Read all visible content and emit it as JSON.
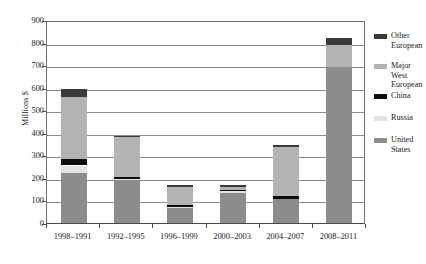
{
  "chart_data": {
    "type": "bar",
    "stacked": true,
    "title": "",
    "xlabel": "",
    "ylabel": "Millions $",
    "ylim": [
      0,
      900
    ],
    "ytick_step": 100,
    "yticks": [
      0,
      100,
      200,
      300,
      400,
      500,
      600,
      700,
      800,
      900
    ],
    "grid": true,
    "legend_position": "right",
    "categories": [
      "1998–1991",
      "1992–1995",
      "1996–1999",
      "2000–2003",
      "2004–2007",
      "2008–2011"
    ],
    "series": [
      {
        "name": "United States",
        "color": "#8c8c8c",
        "values": [
          220,
          190,
          65,
          133,
          105,
          690
        ]
      },
      {
        "name": "Russia",
        "color": "#e3e3e3",
        "values": [
          35,
          5,
          5,
          7,
          0,
          0
        ]
      },
      {
        "name": "China",
        "color": "#0d0d0d",
        "values": [
          30,
          10,
          8,
          8,
          13,
          0
        ]
      },
      {
        "name": "Major West European",
        "color": "#b3b3b3",
        "values": [
          275,
          175,
          82,
          12,
          217,
          100
        ]
      },
      {
        "name": "Other European",
        "color": "#3b3b3b",
        "values": [
          35,
          8,
          10,
          10,
          13,
          30
        ]
      }
    ],
    "totals": [
      595,
      388,
      170,
      170,
      348,
      820
    ]
  },
  "legend": {
    "items": [
      {
        "label": "Other\nEuropean",
        "color": "#3b3b3b"
      },
      {
        "label": "Major West\nEuropean",
        "color": "#b3b3b3"
      },
      {
        "label": "China",
        "color": "#0d0d0d"
      },
      {
        "label": "Russia",
        "color": "#e3e3e3"
      },
      {
        "label": "United\nStates",
        "color": "#8c8c8c"
      }
    ]
  },
  "axes": {
    "y_title": "Millions $",
    "y_tick_labels": [
      "900",
      "800",
      "700",
      "600",
      "500",
      "400",
      "300",
      "200",
      "100",
      "0"
    ],
    "x_tick_labels": [
      "1998–1991",
      "1992–1995",
      "1996–1999",
      "2000–2003",
      "2004–2007",
      "2008–2011"
    ]
  }
}
